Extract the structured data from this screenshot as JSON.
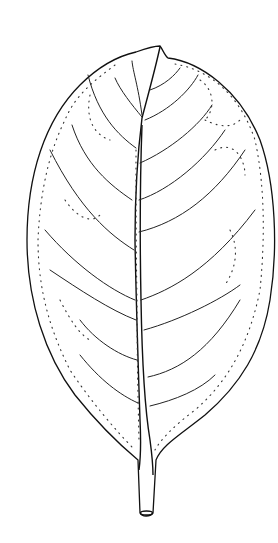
{
  "image": {
    "subject": "leaf",
    "style": "botanical line drawing",
    "description": "Ovate-elliptic simple leaf with pinnate venation, central midrib, curved lateral veins, dotted intramarginal veins and short petiole",
    "colors": {
      "background": "#ffffff",
      "ink": "#111111"
    },
    "lateral_vein_pairs": 8
  }
}
